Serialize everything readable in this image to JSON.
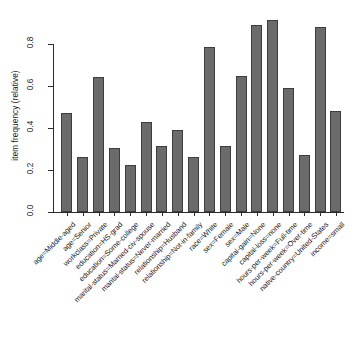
{
  "chart_data": {
    "type": "bar",
    "title": "",
    "subtitle": "",
    "xlabel": "",
    "ylabel": "item frequency (relative)",
    "ylim": [
      0,
      0.95
    ],
    "grid": false,
    "legend": "none",
    "y_ticks": [
      "0.0",
      "0.2",
      "0.4",
      "0.6",
      "0.8"
    ],
    "y_tick_values": [
      0.0,
      0.2,
      0.4,
      0.6,
      0.8
    ],
    "categories": [
      "age=Middle-aged",
      "age=Senior",
      "workclass=Private",
      "education=HS-grad",
      "education=Some-college",
      "marital-status=Married-civ-spouse",
      "marital-status=Never-married",
      "relationship=Husband",
      "relationship=Not-in-family",
      "race=White",
      "sex=Female",
      "sex=Male",
      "capital-gain=None",
      "capital-loss=none",
      "hours-per-week=Full-time",
      "hours-per-week=Over-time",
      "native-country=United-States",
      "income=small"
    ],
    "values": [
      0.47,
      0.26,
      0.645,
      0.305,
      0.225,
      0.43,
      0.315,
      0.39,
      0.26,
      0.785,
      0.315,
      0.65,
      0.89,
      0.915,
      0.59,
      0.27,
      0.88,
      0.48
    ],
    "bar_color": "#6b6b6b",
    "bar_border_color": "#3d3d3d",
    "axis_color": "#2b2b2b",
    "background_color": "#ffffff"
  }
}
